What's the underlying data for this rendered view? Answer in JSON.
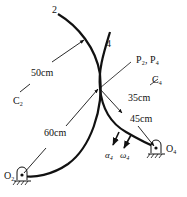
{
  "diagram": {
    "type": "mechanism",
    "labels": {
      "link2": "2",
      "link4": "4",
      "contact_point": "P₂, P₄",
      "center2": "C",
      "center2_sub": "2",
      "center4": "C",
      "center4_sub": "4",
      "pivot2": "O",
      "pivot2_sub": "2",
      "pivot4": "O",
      "pivot4_sub": "4",
      "dim_r2": "50cm",
      "dim_o2p": "60cm",
      "dim_r4": "35cm",
      "dim_o4p": "45cm",
      "alpha": "α",
      "alpha_sub": "4",
      "omega": "ω",
      "omega_sub": "4"
    },
    "colors": {
      "line": "#111111",
      "background": "#ffffff"
    }
  }
}
